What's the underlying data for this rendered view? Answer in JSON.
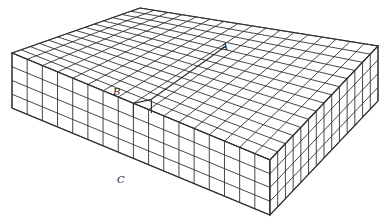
{
  "diagram": {
    "labels": [
      {
        "id": "A",
        "text": "A",
        "x": 221,
        "y": 41
      },
      {
        "id": "B",
        "text": "B",
        "x": 113,
        "y": 86
      },
      {
        "id": "C",
        "text": "C",
        "x": 117,
        "y": 174
      }
    ],
    "colors": {
      "line": "#333333",
      "face": "#ffffff"
    }
  }
}
